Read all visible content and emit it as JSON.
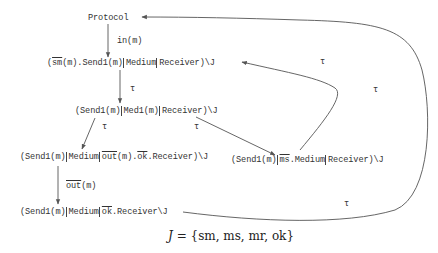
{
  "nodes": {
    "protocol": {
      "text": "Protocol"
    },
    "n2": {
      "p1": "(",
      "bar": "sm",
      "p2": "(m).Send1(m)",
      "p3": "Medium",
      "p4": "Receiver)\\J"
    },
    "n3": {
      "p1": "(Send1(m)",
      "p2": "Med1(m)",
      "p3": "Receiver)\\J"
    },
    "n4": {
      "p1": "(Send1(m)",
      "p2": "Medium",
      "bar1": "out",
      "p3": "(m).",
      "bar2": "ok",
      "p4": ".Receiver)\\J"
    },
    "n5": {
      "p1": "(Send1(m)",
      "bar": "ms",
      "p2": ".Medium",
      "p3": "Receiver)\\J"
    },
    "n6": {
      "p1": "(Send1(m)",
      "p2": "Medium",
      "bar": "ok",
      "p3": ".Receiver\\J"
    }
  },
  "edges": {
    "e1": {
      "label": "in(m)"
    },
    "e2": {
      "label": "τ"
    },
    "e3": {
      "label": "τ"
    },
    "e4": {
      "label": "τ"
    },
    "e5": {
      "label_bar": "out",
      "label_rest": "(m)"
    },
    "e6": {
      "label": "τ"
    },
    "e7_top": {
      "label": "τ"
    },
    "e7_bottom": {
      "label": "τ"
    }
  },
  "formula": {
    "lhs": "J",
    "eq": " = ",
    "rhs": "{sm, ms, mr, ok}"
  }
}
